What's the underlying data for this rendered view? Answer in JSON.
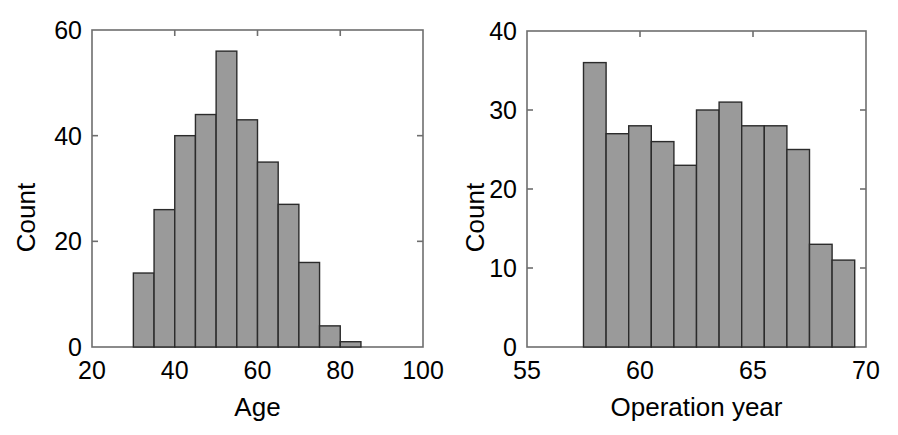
{
  "figure": {
    "width": 898,
    "height": 435,
    "background": "#ffffff",
    "bar_fill": "#9a9a9a",
    "bar_edge": "#2b2b2b",
    "axis_color": "#6e6e6e",
    "text_color": "#000000"
  },
  "chart_data": [
    {
      "type": "bar",
      "id": "age-histogram",
      "title": "",
      "xlabel": "Age",
      "ylabel": "Count",
      "xlim": [
        20,
        100
      ],
      "ylim": [
        0,
        60
      ],
      "xticks": [
        20,
        40,
        60,
        80,
        100
      ],
      "xtick_labels": [
        "20",
        "40",
        "60",
        "80",
        "100"
      ],
      "yticks": [
        0,
        20,
        40,
        60
      ],
      "ytick_labels": [
        "0",
        "20",
        "40",
        "60"
      ],
      "grid": false,
      "legend": "none",
      "bin_width": 5,
      "bin_edges": [
        30,
        35,
        40,
        45,
        50,
        55,
        60,
        65,
        70,
        75,
        80,
        85
      ],
      "categories": [
        "30-35",
        "35-40",
        "40-45",
        "45-50",
        "50-55",
        "55-60",
        "60-65",
        "65-70",
        "70-75",
        "75-80",
        "80-85"
      ],
      "values": [
        14,
        26,
        40,
        44,
        56,
        43,
        35,
        27,
        16,
        4,
        1
      ]
    },
    {
      "type": "bar",
      "id": "operation-year-histogram",
      "title": "",
      "xlabel": "Operation year",
      "ylabel": "Count",
      "xlim": [
        55,
        70
      ],
      "ylim": [
        0,
        40
      ],
      "xticks": [
        55,
        60,
        65,
        70
      ],
      "xtick_labels": [
        "55",
        "60",
        "65",
        "70"
      ],
      "yticks": [
        0,
        10,
        20,
        30,
        40
      ],
      "ytick_labels": [
        "0",
        "10",
        "20",
        "30",
        "40"
      ],
      "grid": false,
      "legend": "none",
      "bin_width": 1,
      "bin_edges": [
        57.5,
        58.5,
        59.5,
        60.5,
        61.5,
        62.5,
        63.5,
        64.5,
        65.5,
        66.5,
        67.5,
        68.5,
        69.5
      ],
      "categories": [
        "58",
        "59",
        "60",
        "61",
        "62",
        "63",
        "64",
        "65",
        "66",
        "67",
        "68",
        "69"
      ],
      "values": [
        36,
        27,
        28,
        26,
        23,
        30,
        31,
        28,
        28,
        25,
        13,
        11
      ]
    }
  ]
}
